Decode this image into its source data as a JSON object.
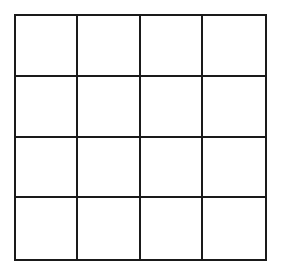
{
  "diagram": {
    "type": "grid",
    "rows": 4,
    "columns": 4,
    "cells": [
      [
        "",
        "",
        "",
        ""
      ],
      [
        "",
        "",
        "",
        ""
      ],
      [
        "",
        "",
        "",
        ""
      ],
      [
        "",
        "",
        "",
        ""
      ]
    ],
    "line_color": "#1a1a1a",
    "background_color": "#ffffff"
  }
}
